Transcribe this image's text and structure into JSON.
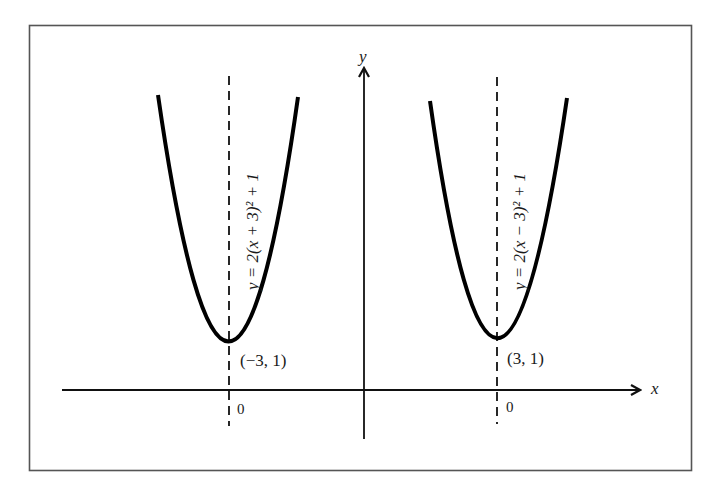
{
  "figure": {
    "type": "diagram",
    "colors": {
      "stroke": "#111111",
      "background": "#ffffff",
      "frame": "#555555"
    },
    "axes": {
      "x_label": "x",
      "y_label": "y"
    },
    "curves": [
      {
        "id": "left-parabola",
        "equation": "y = 2(x + 3)² + 1",
        "vertex_label": "(−3, 1)",
        "axis_tick_label": "0"
      },
      {
        "id": "right-parabola",
        "equation": "y = 2(x − 3)² + 1",
        "vertex_label": "(3, 1)",
        "axis_tick_label": "0"
      }
    ]
  }
}
